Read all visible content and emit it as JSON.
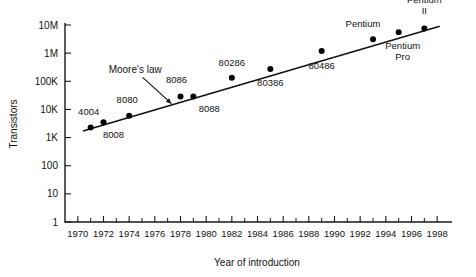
{
  "chart_data": {
    "type": "scatter",
    "title": "",
    "xlabel": "Year of introduction",
    "ylabel": "Transistors",
    "xlim": [
      1969,
      1999
    ],
    "ylim": [
      1,
      10000000
    ],
    "yscale": "log",
    "grid": false,
    "legend": "none",
    "x_tick_labels": [
      "1970",
      "1972",
      "1974",
      "1976",
      "1978",
      "1980",
      "1982",
      "1984",
      "1986",
      "1988",
      "1990",
      "1992",
      "1994",
      "1996",
      "1998"
    ],
    "x_tick_values": [
      1970,
      1972,
      1974,
      1976,
      1978,
      1980,
      1982,
      1984,
      1986,
      1988,
      1990,
      1992,
      1994,
      1996,
      1998
    ],
    "x_minor_tick_values": [
      1971,
      1973,
      1975,
      1977,
      1979,
      1981,
      1983,
      1985,
      1987,
      1989,
      1991,
      1993,
      1995,
      1997
    ],
    "y_tick_labels": [
      "10M",
      "1M",
      "100K",
      "10K",
      "1K",
      "100",
      "10",
      "1"
    ],
    "y_tick_values": [
      10000000,
      1000000,
      100000,
      10000,
      1000,
      100,
      10,
      1
    ],
    "points": [
      {
        "label": "4004",
        "x": 1971,
        "y": 2300,
        "label_dx": -2,
        "label_dy": -12,
        "anchor": "middle"
      },
      {
        "label": "8008",
        "x": 1972,
        "y": 3500,
        "label_dx": 10,
        "label_dy": 16,
        "anchor": "middle"
      },
      {
        "label": "8080",
        "x": 1974,
        "y": 6000,
        "label_dx": -2,
        "label_dy": -13,
        "anchor": "middle"
      },
      {
        "label": "8086",
        "x": 1978,
        "y": 29000,
        "label_dx": -4,
        "label_dy": -13,
        "anchor": "middle"
      },
      {
        "label": "8088",
        "x": 1979,
        "y": 29000,
        "label_dx": 16,
        "label_dy": 16,
        "anchor": "middle"
      },
      {
        "label": "80286",
        "x": 1982,
        "y": 134000,
        "label_dx": 0,
        "label_dy": -12,
        "anchor": "middle"
      },
      {
        "label": "80386",
        "x": 1985,
        "y": 275000,
        "label_dx": 0,
        "label_dy": 17,
        "anchor": "middle"
      },
      {
        "label": "80486",
        "x": 1989,
        "y": 1200000,
        "label_dx": 0,
        "label_dy": 18,
        "anchor": "middle"
      },
      {
        "label": "Pentium",
        "x": 1993,
        "y": 3100000,
        "label_dx": -10,
        "label_dy": -12,
        "anchor": "middle"
      },
      {
        "label": "Pentium\nPro",
        "x": 1995,
        "y": 5500000,
        "label_dx": 4,
        "label_dy": 17,
        "anchor": "middle"
      },
      {
        "label": "Pentium\nII",
        "x": 1997,
        "y": 7500000,
        "label_dx": 0,
        "label_dy": -26,
        "anchor": "middle"
      }
    ],
    "trend_line": {
      "name": "Moore's law",
      "x_start": 1970.4,
      "x_end": 1998.2,
      "y_start": 1700,
      "y_end": 9000000
    },
    "annotation": {
      "text": "Moore's law",
      "text_x": 1972.4,
      "text_y": 190000,
      "arrow_to_x": 1977.3,
      "arrow_to_y": 16000
    }
  }
}
